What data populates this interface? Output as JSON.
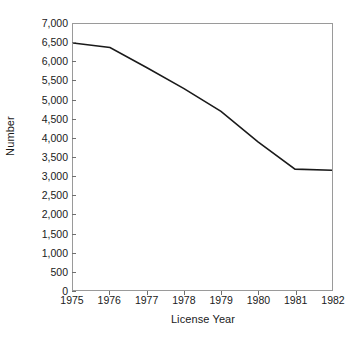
{
  "chart_data": {
    "type": "line",
    "title": "",
    "xlabel": "License Year",
    "ylabel": "Number",
    "categories": [
      "1975",
      "1976",
      "1977",
      "1978",
      "1979",
      "1980",
      "1981",
      "1982"
    ],
    "x": [
      1975,
      1976,
      1977,
      1978,
      1979,
      1980,
      1981,
      1982
    ],
    "values": [
      6500,
      6380,
      5850,
      5300,
      4700,
      3900,
      3180,
      3150
    ],
    "series": [
      {
        "name": "Number",
        "values": [
          6500,
          6380,
          5850,
          5300,
          4700,
          3900,
          3180,
          3150
        ]
      }
    ],
    "xlim": [
      1975,
      1982
    ],
    "ylim": [
      0,
      7000
    ],
    "ytick_labels": [
      "0",
      "500",
      "1,000",
      "1,500",
      "2,000",
      "2,500",
      "3,000",
      "3,500",
      "4,000",
      "4,500",
      "5,000",
      "5,500",
      "6,000",
      "6,500",
      "7,000"
    ],
    "ytick_values": [
      0,
      500,
      1000,
      1500,
      2000,
      2500,
      3000,
      3500,
      4000,
      4500,
      5000,
      5500,
      6000,
      6500,
      7000
    ],
    "xtick_labels": [
      "1975",
      "1976",
      "1977",
      "1978",
      "1979",
      "1980",
      "1981",
      "1982"
    ],
    "grid": false,
    "legend": null,
    "line_color": "#1a1a1a",
    "frame_color": "#9a9a9a",
    "background_color": "#ffffff"
  }
}
